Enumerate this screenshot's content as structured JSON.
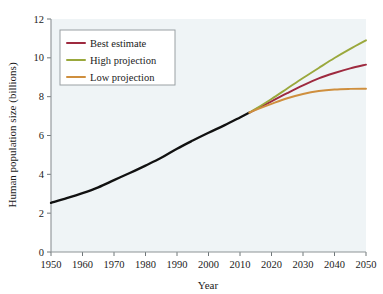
{
  "chart_data": {
    "type": "line",
    "title": "",
    "xlabel": "Year",
    "ylabel": "Human population size (billions)",
    "xlim": [
      1950,
      2050
    ],
    "ylim": [
      0,
      12
    ],
    "grid": false,
    "legend_position": "top-left",
    "xticks": [
      "1950",
      "1960",
      "1970",
      "1980",
      "1990",
      "2000",
      "2010",
      "2020",
      "2030",
      "2040",
      "2050"
    ],
    "yticks": [
      "0",
      "2",
      "4",
      "6",
      "8",
      "10",
      "12"
    ],
    "x": [
      1950,
      1955,
      1960,
      1965,
      1970,
      1975,
      1980,
      1985,
      1990,
      1995,
      2000,
      2005,
      2010,
      2013,
      2015,
      2020,
      2025,
      2030,
      2035,
      2040,
      2045,
      2050
    ],
    "series": [
      {
        "name": "Historical",
        "color": "#111111",
        "in_legend": false,
        "x": [
          1950,
          1955,
          1960,
          1965,
          1970,
          1975,
          1980,
          1985,
          1990,
          1995,
          2000,
          2005,
          2010,
          2013
        ],
        "values": [
          2.53,
          2.77,
          3.03,
          3.33,
          3.7,
          4.07,
          4.45,
          4.85,
          5.32,
          5.74,
          6.14,
          6.52,
          6.93,
          7.18
        ]
      },
      {
        "name": "Best estimate",
        "color": "#9e2a3f",
        "in_legend": true,
        "x": [
          2013,
          2015,
          2020,
          2025,
          2030,
          2035,
          2040,
          2045,
          2050
        ],
        "values": [
          7.18,
          7.35,
          7.76,
          8.18,
          8.58,
          8.94,
          9.22,
          9.46,
          9.65
        ]
      },
      {
        "name": "High projection",
        "color": "#9aa83c",
        "in_legend": true,
        "x": [
          2013,
          2015,
          2020,
          2025,
          2030,
          2035,
          2040,
          2045,
          2050
        ],
        "values": [
          7.18,
          7.37,
          7.88,
          8.42,
          8.96,
          9.48,
          9.99,
          10.46,
          10.9
        ]
      },
      {
        "name": "Low projection",
        "color": "#cf8f3e",
        "in_legend": true,
        "x": [
          2013,
          2015,
          2020,
          2025,
          2030,
          2035,
          2040,
          2045,
          2050
        ],
        "values": [
          7.18,
          7.32,
          7.63,
          7.92,
          8.14,
          8.29,
          8.37,
          8.4,
          8.41
        ]
      }
    ]
  },
  "legend": {
    "items": [
      {
        "label": "Best estimate",
        "color": "#9e2a3f"
      },
      {
        "label": "High projection",
        "color": "#9aa83c"
      },
      {
        "label": "Low projection",
        "color": "#cf8f3e"
      }
    ]
  },
  "colors": {
    "plot_background": "#eff4f6",
    "page_background": "#ffffff",
    "axis": "#8d9396",
    "text": "#1b1b1b",
    "historical": "#111111"
  }
}
